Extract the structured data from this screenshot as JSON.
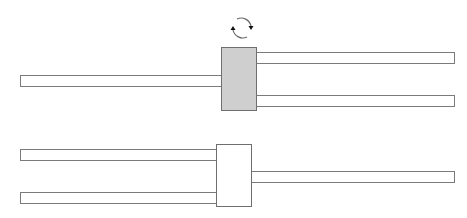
{
  "diagram": {
    "description": "Two block-and-lead configurations: top shows a shaded block with one lead on the left and two leads on the right, with a rotation (flip) arrow above; bottom shows the flipped result with two leads on the left and one lead on the right.",
    "colors": {
      "outline": "#7a7a7a",
      "shaded_block": "#cfcfcf",
      "white": "#ffffff"
    },
    "top": {
      "block": {
        "fill": "shaded",
        "x": 221,
        "y": 47,
        "w": 36,
        "h": 64
      },
      "rotation_indicator": "circular-arrows-icon",
      "left_leads": [
        {
          "x": 20,
          "y": 75,
          "w": 201,
          "h": 12
        }
      ],
      "right_leads": [
        {
          "x": 257,
          "y": 52,
          "w": 198,
          "h": 12
        },
        {
          "x": 257,
          "y": 95,
          "w": 198,
          "h": 12
        }
      ]
    },
    "bottom": {
      "block": {
        "fill": "white",
        "x": 216,
        "y": 144,
        "w": 36,
        "h": 63
      },
      "left_leads": [
        {
          "x": 20,
          "y": 149,
          "w": 196,
          "h": 12
        },
        {
          "x": 20,
          "y": 192,
          "w": 196,
          "h": 12
        }
      ],
      "right_leads": [
        {
          "x": 252,
          "y": 171,
          "w": 203,
          "h": 12
        }
      ]
    }
  }
}
